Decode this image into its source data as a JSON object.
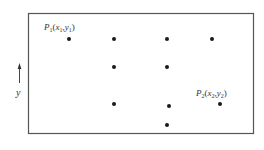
{
  "diagram": {
    "type": "point grid in rectangular region",
    "frame": {
      "x": 28,
      "y": 13,
      "width": 225,
      "height": 120,
      "stroke": "#555555"
    },
    "axis": {
      "label": "y",
      "arrow": {
        "x": 19,
        "y_from": 83,
        "y_to": 64
      }
    },
    "labels": {
      "p1": {
        "name": "P",
        "sub": "1",
        "open": "(",
        "x": "x",
        "x_sub": "1",
        "comma": ",",
        "y": "y",
        "y_sub": "1",
        "close": ")"
      },
      "p2": {
        "name": "P",
        "sub": "2",
        "open": "(",
        "x": "x",
        "x_sub": "2",
        "comma": ",",
        "y": "y",
        "y_sub": "2",
        "close": ")"
      }
    },
    "points": [
      {
        "id": "P1",
        "x": 69,
        "y": 39
      },
      {
        "id": "pt-2",
        "x": 114,
        "y": 39
      },
      {
        "id": "pt-3",
        "x": 167,
        "y": 39
      },
      {
        "id": "pt-4",
        "x": 212,
        "y": 39
      },
      {
        "id": "pt-5",
        "x": 114,
        "y": 67
      },
      {
        "id": "pt-6",
        "x": 167,
        "y": 67
      },
      {
        "id": "pt-7",
        "x": 114,
        "y": 104
      },
      {
        "id": "pt-8",
        "x": 169,
        "y": 106
      },
      {
        "id": "P2",
        "x": 220,
        "y": 104
      },
      {
        "id": "pt-10",
        "x": 167,
        "y": 125
      }
    ],
    "point_color": "#1a1a1a",
    "point_radius": 2
  }
}
